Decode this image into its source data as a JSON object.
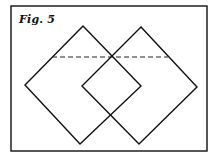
{
  "figure": {
    "caption": "Fig. 5",
    "frame": {
      "x": 11,
      "y": 6,
      "width": 196,
      "height": 145
    },
    "shapes": [
      {
        "name": "left-diamond",
        "points": [
          [
            83,
            26
          ],
          [
            141,
            86
          ],
          [
            80,
            144
          ],
          [
            25,
            85
          ]
        ]
      },
      {
        "name": "right-diamond",
        "points": [
          [
            141,
            27
          ],
          [
            197,
            87
          ],
          [
            139,
            144
          ],
          [
            82,
            86
          ]
        ]
      }
    ],
    "dashed_line": {
      "x1": 52,
      "y1": 57,
      "x2": 168,
      "y2": 57
    },
    "colors": {
      "line": "#111111",
      "background": "#ffffff"
    }
  }
}
